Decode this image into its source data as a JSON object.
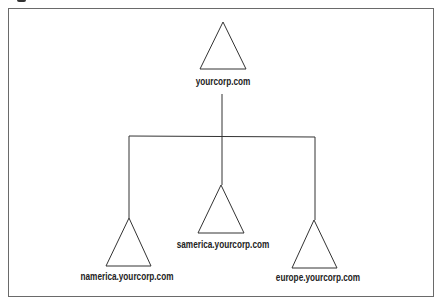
{
  "diagram": {
    "type": "domain-tree",
    "colors": {
      "line": "#333333",
      "frame": "#6a6a6a",
      "text": "#222222",
      "background": "#ffffff"
    },
    "root": {
      "label": "yourcorp.com",
      "icon": "triangle-domain-icon"
    },
    "children": [
      {
        "label": "namerica.yourcorp.com",
        "icon": "triangle-domain-icon"
      },
      {
        "label": "samerica.yourcorp.com",
        "icon": "triangle-domain-icon"
      },
      {
        "label": "europe.yourcorp.com",
        "icon": "triangle-domain-icon"
      }
    ]
  }
}
